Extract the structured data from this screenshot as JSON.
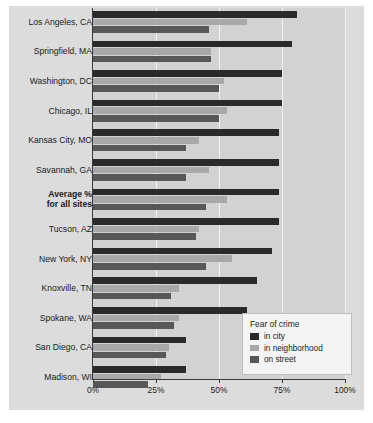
{
  "chart_data": {
    "type": "bar",
    "orientation": "horizontal",
    "title": "",
    "xlabel": "",
    "ylabel": "",
    "xlim": [
      0,
      100
    ],
    "xticks": [
      "0%",
      "25%",
      "50%",
      "75%",
      "100%"
    ],
    "xtick_values": [
      0,
      25,
      50,
      75,
      100
    ],
    "grid": true,
    "legend_title": "Fear of crime",
    "legend_position": "bottom-right inside plot",
    "categories": [
      "Los Angeles, CA",
      "Springfield, MA",
      "Washington, DC",
      "Chicago, IL",
      "Kansas City, MO",
      "Savannah, GA",
      "Average %\nfor all sites",
      "Tucson, AZ",
      "New York, NY",
      "Knoxville, TN",
      "Spokane, WA",
      "San Diego, CA",
      "Madison, WI"
    ],
    "series": [
      {
        "name": "in city",
        "color": "#2a2a2a",
        "values": [
          81,
          79,
          75,
          75,
          74,
          74,
          74,
          74,
          71,
          65,
          61,
          37,
          37
        ]
      },
      {
        "name": "in neighborhood",
        "color": "#a8a8a8",
        "values": [
          61,
          47,
          52,
          53,
          42,
          46,
          53,
          42,
          55,
          34,
          34,
          30,
          27
        ]
      },
      {
        "name": "on street",
        "color": "#575757",
        "values": [
          46,
          47,
          50,
          50,
          37,
          37,
          45,
          41,
          45,
          31,
          32,
          29,
          22
        ]
      }
    ]
  },
  "rows": [
    {
      "label": "Los Angeles, CA",
      "label2": "",
      "bold": false
    },
    {
      "label": "Springfield, MA",
      "label2": "",
      "bold": false
    },
    {
      "label": "Washington, DC",
      "label2": "",
      "bold": false
    },
    {
      "label": "Chicago, IL",
      "label2": "",
      "bold": false
    },
    {
      "label": "Kansas City, MO",
      "label2": "",
      "bold": false
    },
    {
      "label": "Savannah, GA",
      "label2": "",
      "bold": false
    },
    {
      "label": "Average %",
      "label2": "for all sites",
      "bold": true
    },
    {
      "label": "Tucson, AZ",
      "label2": "",
      "bold": false
    },
    {
      "label": "New York, NY",
      "label2": "",
      "bold": false
    },
    {
      "label": "Knoxville, TN",
      "label2": "",
      "bold": false
    },
    {
      "label": "Spokane, WA",
      "label2": "",
      "bold": false
    },
    {
      "label": "San Diego, CA",
      "label2": "",
      "bold": false
    },
    {
      "label": "Madison, WI",
      "label2": "",
      "bold": false
    }
  ],
  "axis": {
    "ticks": [
      "0%",
      "25%",
      "50%",
      "75%",
      "100%"
    ]
  },
  "legend": {
    "title": "Fear of crime",
    "items": [
      {
        "label": "in city",
        "color": "#2a2a2a"
      },
      {
        "label": "in neighborhood",
        "color": "#a8a8a8"
      },
      {
        "label": "on street",
        "color": "#575757"
      }
    ]
  }
}
